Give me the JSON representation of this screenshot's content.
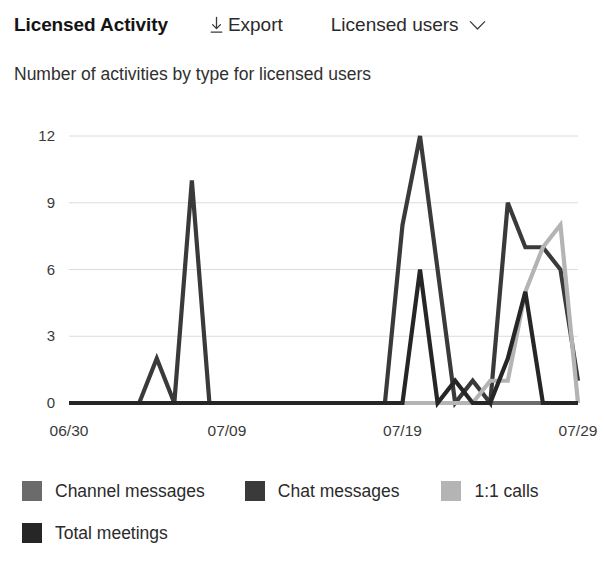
{
  "header": {
    "title": "Licensed Activity",
    "export_label": "Export",
    "export_icon": "download-icon",
    "filter_value": "Licensed users",
    "filter_icon": "chevron-down-icon"
  },
  "subtitle": "Number of activities by type for licensed users",
  "chart_data": {
    "type": "line",
    "title": "Number of activities by type for licensed users",
    "xlabel": "",
    "ylabel": "",
    "ylim": [
      0,
      12
    ],
    "yticks": [
      0,
      3,
      6,
      9,
      12
    ],
    "grid": true,
    "legend_position": "bottom",
    "x": [
      "06/30",
      "07/01",
      "07/02",
      "07/03",
      "07/04",
      "07/05",
      "07/06",
      "07/07",
      "07/08",
      "07/09",
      "07/10",
      "07/11",
      "07/12",
      "07/13",
      "07/14",
      "07/15",
      "07/16",
      "07/17",
      "07/18",
      "07/19",
      "07/20",
      "07/21",
      "07/22",
      "07/23",
      "07/24",
      "07/25",
      "07/26",
      "07/27",
      "07/28",
      "07/29"
    ],
    "xticks": [
      "06/30",
      "07/09",
      "07/19",
      "07/29"
    ],
    "xtick_index": [
      0,
      9,
      19,
      29
    ],
    "series": [
      {
        "name": "Channel messages",
        "color": "#6b6b6b",
        "values": [
          0,
          0,
          0,
          0,
          0,
          0,
          0,
          0,
          0,
          0,
          0,
          0,
          0,
          0,
          0,
          0,
          0,
          0,
          0,
          0,
          0,
          0,
          0,
          0,
          0,
          0,
          0,
          0,
          0,
          0
        ]
      },
      {
        "name": "Chat messages",
        "color": "#3a3a3a",
        "values": [
          0,
          0,
          0,
          0,
          0,
          2,
          0,
          10,
          0,
          0,
          0,
          0,
          0,
          0,
          0,
          0,
          0,
          0,
          0,
          8,
          12,
          6,
          0,
          1,
          0,
          9,
          7,
          7,
          6,
          1
        ]
      },
      {
        "name": "1:1 calls",
        "color": "#b4b4b4",
        "values": [
          0,
          0,
          0,
          0,
          0,
          0,
          0,
          0,
          0,
          0,
          0,
          0,
          0,
          0,
          0,
          0,
          0,
          0,
          0,
          0,
          0,
          0,
          0,
          0,
          1,
          1,
          5,
          7,
          8,
          0
        ]
      },
      {
        "name": "Total meetings",
        "color": "#262626",
        "values": [
          0,
          0,
          0,
          0,
          0,
          0,
          0,
          0,
          0,
          0,
          0,
          0,
          0,
          0,
          0,
          0,
          0,
          0,
          0,
          0,
          6,
          0,
          1,
          0,
          0,
          2,
          5,
          0,
          0,
          0
        ]
      }
    ]
  },
  "legend": {
    "rows": [
      [
        {
          "label": "Channel messages",
          "color": "#6b6b6b"
        },
        {
          "label": "Chat messages",
          "color": "#3a3a3a"
        },
        {
          "label": "1:1 calls",
          "color": "#b4b4b4"
        }
      ],
      [
        {
          "label": "Total meetings",
          "color": "#262626"
        }
      ]
    ]
  }
}
